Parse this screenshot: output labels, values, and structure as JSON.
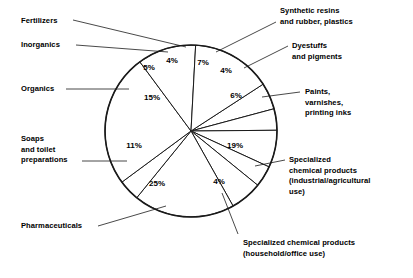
{
  "chart_data": {
    "type": "pie",
    "title": "",
    "subtitle": "",
    "xlabel": "",
    "ylabel": "",
    "legend_position": "callout-labels",
    "grid": false,
    "units": "percent",
    "total": 100,
    "categories": [
      "Fertilizers",
      "Inorganics",
      "Synthetic resins and rubber, plastics",
      "Dyestuffs and pigments",
      "Paints, varnishes, printing inks",
      "Specialized chemical products (industrial/agricultural use)",
      "Specialized chemical products (household/office use)",
      "Pharmaceuticals",
      "Soaps and toilet preparations",
      "Organics"
    ],
    "values": [
      5,
      4,
      7,
      4,
      6,
      19,
      4,
      25,
      11,
      15
    ],
    "slices": [
      {
        "label": "Fertilizers",
        "value": 5,
        "value_text": "5%",
        "start_deg": -33,
        "end_deg": -15,
        "pct_x": 149,
        "pct_y": 70
      },
      {
        "label": "Inorganics",
        "value": 4,
        "value_text": "4%",
        "start_deg": -15,
        "end_deg": -0.5,
        "pct_x": 172,
        "pct_y": 63
      },
      {
        "label": "Synthetic resins and rubber, plastics",
        "value": 7,
        "value_text": "7%",
        "start_deg": -0.5,
        "end_deg": 24.7,
        "pct_x": 203,
        "pct_y": 65
      },
      {
        "label": "Dyestuffs and pigments",
        "value": 4,
        "value_text": "4%",
        "start_deg": 24.7,
        "end_deg": 39.1,
        "pct_x": 226,
        "pct_y": 73
      },
      {
        "label": "Paints, varnishes, printing inks",
        "value": 6,
        "value_text": "6%",
        "start_deg": 39.1,
        "end_deg": 60.7,
        "pct_x": 236,
        "pct_y": 98
      },
      {
        "label": "Specialized chemical products (industrial/agricultural use)",
        "value": 19,
        "value_text": "19%",
        "start_deg": 60.7,
        "end_deg": 129.1,
        "pct_x": 235,
        "pct_y": 148
      },
      {
        "label": "Specialized chemical products (household/office use)",
        "value": 4,
        "value_text": "4%",
        "start_deg": 129.1,
        "end_deg": 143.5,
        "pct_x": 219,
        "pct_y": 184
      },
      {
        "label": "Pharmaceuticals",
        "value": 25,
        "value_text": "25%",
        "start_deg": 143.5,
        "end_deg": 233.5,
        "pct_x": 157,
        "pct_y": 186
      },
      {
        "label": "Soaps and toilet preparations",
        "value": 11,
        "value_text": "11%",
        "start_deg": 233.5,
        "end_deg": 273.1,
        "pct_x": 134,
        "pct_y": 148
      },
      {
        "label": "Organics",
        "value": 15,
        "value_text": "15%",
        "start_deg": 273.1,
        "end_deg": 327,
        "pct_x": 152,
        "pct_y": 100
      }
    ],
    "geometry": {
      "cx": 191,
      "cy": 131,
      "r": 86
    }
  },
  "callouts": {
    "fertilizers": "Fertilizers",
    "inorganics": "Inorganics",
    "organics": "Organics",
    "soaps": "Soaps\nand toilet\npreparations",
    "pharmaceuticals": "Pharmaceuticals",
    "synthetic_resins": "Synthetic resins\nand rubber, plastics",
    "dyestuffs": "Dyestuffs\nand pigments",
    "paints": "Paints,\nvarnishes,\nprinting inks",
    "specialized_industrial": "Specialized\nchemical products\n(industrial/agricultural\nuse)",
    "specialized_household": "Specialized chemical products\n(household/office use)"
  },
  "colors": {
    "stroke": "#1a1a1a",
    "fill": "#ffffff",
    "text": "#000000",
    "background": "#ffffff"
  }
}
